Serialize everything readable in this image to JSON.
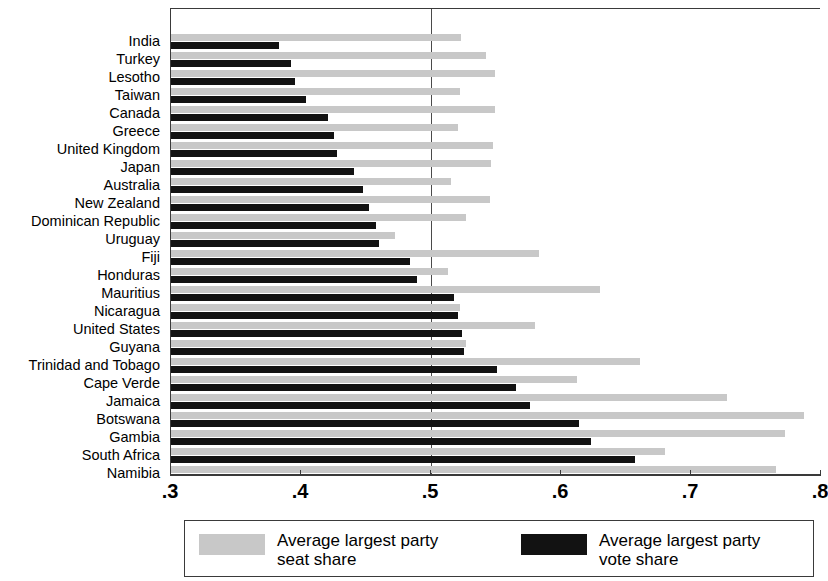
{
  "chart_data": {
    "type": "bar",
    "orientation": "horizontal",
    "title": "",
    "xlabel": "",
    "ylabel": "",
    "xlim": [
      0.3,
      0.8
    ],
    "grid": false,
    "reference_line": 0.5,
    "legend_position": "bottom",
    "tick_labels": [
      ".3",
      ".4",
      ".5",
      ".6",
      ".7",
      ".8"
    ],
    "ticks": [
      0.3,
      0.4,
      0.5,
      0.6,
      0.7,
      0.8
    ],
    "categories": [
      "India",
      "Turkey",
      "Lesotho",
      "Taiwan",
      "Canada",
      "Greece",
      "United Kingdom",
      "Japan",
      "Australia",
      "New Zealand",
      "Dominican Republic",
      "Uruguay",
      "Fiji",
      "Honduras",
      "Mauritius",
      "Nicaragua",
      "United States",
      "Guyana",
      "Trinidad and Tobago",
      "Cape Verde",
      "Jamaica",
      "Botswana",
      "Gambia",
      "South Africa",
      "Namibia"
    ],
    "series": [
      {
        "name": "Average largest party seat share",
        "color": "#c8c8c8",
        "values": [
          0.523,
          0.542,
          0.549,
          0.522,
          0.549,
          0.521,
          0.548,
          0.546,
          0.515,
          0.545,
          0.527,
          0.472,
          0.583,
          0.513,
          0.63,
          0.522,
          0.58,
          0.527,
          0.661,
          0.612,
          0.728,
          0.787,
          0.772,
          0.68,
          0.765
        ]
      },
      {
        "name": "Average largest party vote share",
        "color": "#121212",
        "values": [
          0.383,
          0.392,
          0.395,
          0.404,
          0.421,
          0.425,
          0.428,
          0.441,
          0.448,
          0.452,
          0.458,
          0.46,
          0.484,
          0.489,
          0.518,
          0.521,
          0.524,
          0.525,
          0.551,
          0.565,
          0.576,
          0.614,
          0.623,
          0.657,
          0.766
        ]
      }
    ]
  },
  "legend": {
    "entries": [
      {
        "label": "Average largest party\nseat share",
        "swatch": "seat"
      },
      {
        "label": "Average largest party\nvote share",
        "swatch": "vote"
      }
    ]
  }
}
